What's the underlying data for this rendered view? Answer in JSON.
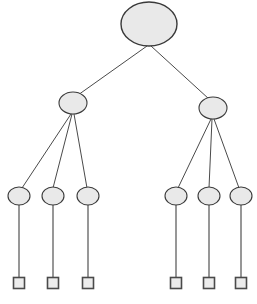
{
  "diagram": {
    "kind": "hierarchical-tree-diagram",
    "title": "",
    "background_color": "#ffffff",
    "canvas": {
      "width": 257,
      "height": 304
    },
    "style": {
      "node_fill": "#e9e9e9",
      "node_stroke": "#3a3a3a",
      "square_fill": "#ececec",
      "square_stroke": "#4a4a4a",
      "edge_stroke": "#4a4a4a",
      "stem_stroke": "#6b6b6b"
    },
    "levels": [
      {
        "index": 0,
        "shape": "ellipse",
        "count": 1
      },
      {
        "index": 1,
        "shape": "ellipse",
        "count": 2
      },
      {
        "index": 2,
        "shape": "ellipse",
        "count": 6
      },
      {
        "index": 3,
        "shape": "square",
        "count": 6
      }
    ],
    "nodes": [
      {
        "id": "root",
        "label": "",
        "shape": "ellipse",
        "cx": 149,
        "cy": 24,
        "rx": 28,
        "ry": 22,
        "level": 0
      },
      {
        "id": "n1",
        "label": "",
        "shape": "ellipse",
        "cx": 73,
        "cy": 103,
        "rx": 14,
        "ry": 11,
        "level": 1
      },
      {
        "id": "n2",
        "label": "",
        "shape": "ellipse",
        "cx": 213,
        "cy": 108,
        "rx": 14,
        "ry": 11,
        "level": 1
      },
      {
        "id": "l1",
        "label": "",
        "shape": "ellipse",
        "cx": 19,
        "cy": 196,
        "rx": 11,
        "ry": 9,
        "level": 2
      },
      {
        "id": "l2",
        "label": "",
        "shape": "ellipse",
        "cx": 53,
        "cy": 196,
        "rx": 11,
        "ry": 9,
        "level": 2
      },
      {
        "id": "l3",
        "label": "",
        "shape": "ellipse",
        "cx": 88,
        "cy": 196,
        "rx": 11,
        "ry": 9,
        "level": 2
      },
      {
        "id": "l4",
        "label": "",
        "shape": "ellipse",
        "cx": 176,
        "cy": 196,
        "rx": 11,
        "ry": 9,
        "level": 2
      },
      {
        "id": "l5",
        "label": "",
        "shape": "ellipse",
        "cx": 209,
        "cy": 196,
        "rx": 11,
        "ry": 9,
        "level": 2
      },
      {
        "id": "l6",
        "label": "",
        "shape": "ellipse",
        "cx": 241,
        "cy": 196,
        "rx": 11,
        "ry": 9,
        "level": 2
      },
      {
        "id": "s1",
        "label": "",
        "shape": "square",
        "cx": 19,
        "cy": 283,
        "size": 11,
        "level": 3
      },
      {
        "id": "s2",
        "label": "",
        "shape": "square",
        "cx": 53,
        "cy": 283,
        "size": 11,
        "level": 3
      },
      {
        "id": "s3",
        "label": "",
        "shape": "square",
        "cx": 88,
        "cy": 283,
        "size": 11,
        "level": 3
      },
      {
        "id": "s4",
        "label": "",
        "shape": "square",
        "cx": 176,
        "cy": 283,
        "size": 11,
        "level": 3
      },
      {
        "id": "s5",
        "label": "",
        "shape": "square",
        "cx": 209,
        "cy": 283,
        "size": 11,
        "level": 3
      },
      {
        "id": "s6",
        "label": "",
        "shape": "square",
        "cx": 241,
        "cy": 283,
        "size": 11,
        "level": 3
      }
    ],
    "edges": [
      {
        "from": "root",
        "to": "n1",
        "x1": 147,
        "y1": 46,
        "x2": 78,
        "y2": 95,
        "kind": "diagonal"
      },
      {
        "from": "root",
        "to": "n2",
        "x1": 151,
        "y1": 46,
        "x2": 209,
        "y2": 99,
        "kind": "diagonal"
      },
      {
        "from": "n1",
        "to": "l1",
        "x1": 71,
        "y1": 114,
        "x2": 22,
        "y2": 188,
        "kind": "diagonal"
      },
      {
        "from": "n1",
        "to": "l2",
        "x1": 72,
        "y1": 114,
        "x2": 53,
        "y2": 188,
        "kind": "diagonal"
      },
      {
        "from": "n1",
        "to": "l3",
        "x1": 74,
        "y1": 114,
        "x2": 87,
        "y2": 188,
        "kind": "diagonal"
      },
      {
        "from": "n2",
        "to": "l4",
        "x1": 211,
        "y1": 119,
        "x2": 178,
        "y2": 188,
        "kind": "diagonal"
      },
      {
        "from": "n2",
        "to": "l5",
        "x1": 212,
        "y1": 119,
        "x2": 209,
        "y2": 188,
        "kind": "diagonal"
      },
      {
        "from": "n2",
        "to": "l6",
        "x1": 214,
        "y1": 119,
        "x2": 239,
        "y2": 188,
        "kind": "diagonal"
      },
      {
        "from": "l1",
        "to": "s1",
        "x1": 19,
        "y1": 205,
        "x2": 19,
        "y2": 278,
        "kind": "vertical"
      },
      {
        "from": "l2",
        "to": "s2",
        "x1": 53,
        "y1": 205,
        "x2": 53,
        "y2": 278,
        "kind": "vertical"
      },
      {
        "from": "l3",
        "to": "s3",
        "x1": 88,
        "y1": 205,
        "x2": 88,
        "y2": 278,
        "kind": "vertical"
      },
      {
        "from": "l4",
        "to": "s4",
        "x1": 176,
        "y1": 205,
        "x2": 176,
        "y2": 278,
        "kind": "vertical"
      },
      {
        "from": "l5",
        "to": "s5",
        "x1": 209,
        "y1": 205,
        "x2": 209,
        "y2": 278,
        "kind": "vertical"
      },
      {
        "from": "l6",
        "to": "s6",
        "x1": 241,
        "y1": 205,
        "x2": 241,
        "y2": 278,
        "kind": "vertical"
      }
    ]
  }
}
